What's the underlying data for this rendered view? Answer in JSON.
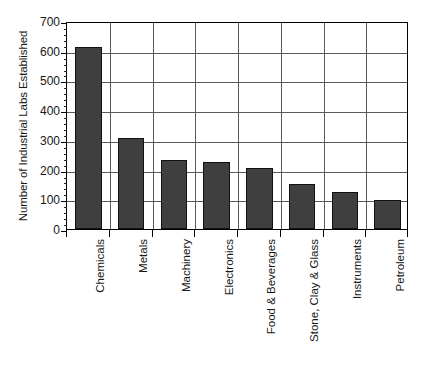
{
  "chart_data": {
    "type": "bar",
    "title": "",
    "subtitle": "",
    "xlabel": "",
    "ylabel": "Number of Industrial Labs Established",
    "ylim": [
      0,
      700
    ],
    "ytick_values": [
      0,
      100,
      200,
      300,
      400,
      500,
      600,
      700
    ],
    "ytick_labels": [
      "0",
      "100",
      "200",
      "300",
      "400",
      "500",
      "600",
      "700"
    ],
    "minor_tick_step": 20,
    "grid": "both",
    "legend": "none",
    "orientation": "vertical",
    "bar_color": "#3f3f3f",
    "bar_edge_color": "#111111",
    "grid_color": "#5a5a5a",
    "axis_color": "#000000",
    "background_color": "#ffffff",
    "xtick_label_rotation": 90,
    "categories": [
      "Chemicals",
      "Metals",
      "Machinery",
      "Electronics",
      "Food & Beverages",
      "Stone, Clay & Glass",
      "Instruments",
      "Petroleum"
    ],
    "values": [
      613,
      305,
      232,
      224,
      205,
      152,
      125,
      97
    ],
    "annotations": []
  }
}
